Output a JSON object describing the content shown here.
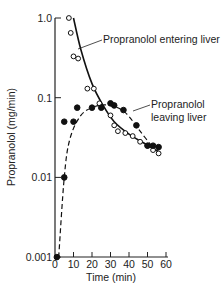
{
  "chart_data": {
    "type": "scatter",
    "title": "",
    "xlabel": "Time (min)",
    "ylabel": "Propranolol (mg/min)",
    "xlim": [
      0,
      60
    ],
    "ylim": [
      0.001,
      1.0
    ],
    "yscale": "log",
    "grid": false,
    "legend_position": "none (inline annotations)",
    "x_ticks": [
      0,
      10,
      20,
      30,
      40,
      50,
      60
    ],
    "x_tick_labels": [
      "0",
      "10",
      "20",
      "30",
      "40",
      "50",
      "60"
    ],
    "y_ticks": [
      0.001,
      0.01,
      0.1,
      1.0
    ],
    "y_tick_labels": [
      "0.001",
      "0.01",
      "0.1",
      "1.0"
    ],
    "series": [
      {
        "name": "Propranolol entering liver",
        "marker": "open-circle",
        "line": "solid",
        "points": [
          {
            "x": 7.5,
            "y": 1.0
          },
          {
            "x": 8.5,
            "y": 0.65
          },
          {
            "x": 10,
            "y": 0.33
          },
          {
            "x": 12.5,
            "y": 0.31
          },
          {
            "x": 17.5,
            "y": 0.13
          },
          {
            "x": 21,
            "y": 0.13
          },
          {
            "x": 24,
            "y": 0.085
          },
          {
            "x": 30,
            "y": 0.06
          },
          {
            "x": 32,
            "y": 0.045
          },
          {
            "x": 34,
            "y": 0.038
          },
          {
            "x": 38,
            "y": 0.036
          },
          {
            "x": 42,
            "y": 0.033
          },
          {
            "x": 46,
            "y": 0.028
          },
          {
            "x": 50,
            "y": 0.025
          },
          {
            "x": 53,
            "y": 0.022
          },
          {
            "x": 56,
            "y": 0.02
          }
        ],
        "curve": [
          {
            "x": 10,
            "y": 1.0
          },
          {
            "x": 14,
            "y": 0.4
          },
          {
            "x": 20,
            "y": 0.15
          },
          {
            "x": 26,
            "y": 0.08
          },
          {
            "x": 32,
            "y": 0.05
          },
          {
            "x": 40,
            "y": 0.035
          },
          {
            "x": 48,
            "y": 0.027
          },
          {
            "x": 56,
            "y": 0.021
          }
        ]
      },
      {
        "name": "Propranolol leaving liver",
        "marker": "filled-circle",
        "line": "dashed",
        "points": [
          {
            "x": 1,
            "y": 0.001
          },
          {
            "x": 5,
            "y": 0.01
          },
          {
            "x": 5,
            "y": 0.05
          },
          {
            "x": 10,
            "y": 0.05
          },
          {
            "x": 12,
            "y": 0.075
          },
          {
            "x": 20,
            "y": 0.075
          },
          {
            "x": 25,
            "y": 0.075
          },
          {
            "x": 30,
            "y": 0.085
          },
          {
            "x": 32,
            "y": 0.08
          },
          {
            "x": 37,
            "y": 0.07
          },
          {
            "x": 44,
            "y": 0.045
          },
          {
            "x": 50,
            "y": 0.025
          },
          {
            "x": 53,
            "y": 0.025
          },
          {
            "x": 56,
            "y": 0.024
          }
        ],
        "curve": [
          {
            "x": 2,
            "y": 0.001
          },
          {
            "x": 5,
            "y": 0.01
          },
          {
            "x": 8,
            "y": 0.03
          },
          {
            "x": 14,
            "y": 0.06
          },
          {
            "x": 22,
            "y": 0.078
          },
          {
            "x": 30,
            "y": 0.08
          },
          {
            "x": 38,
            "y": 0.065
          },
          {
            "x": 46,
            "y": 0.038
          },
          {
            "x": 54,
            "y": 0.022
          }
        ]
      }
    ],
    "annotations": [
      {
        "text": "Propranolol entering liver",
        "points_to": "solid curve near x=10, y=0.4"
      },
      {
        "text": "Propranolol leaving liver",
        "points_to": "dashed curve near x=35, y=0.075"
      }
    ]
  },
  "labels": {
    "x_axis_title": "Time (min)",
    "y_axis_title": "Propranolol (mg/min)",
    "annot_entering": "Propranolol entering liver",
    "annot_leaving_line1": "Propranolol",
    "annot_leaving_line2": "leaving liver"
  }
}
